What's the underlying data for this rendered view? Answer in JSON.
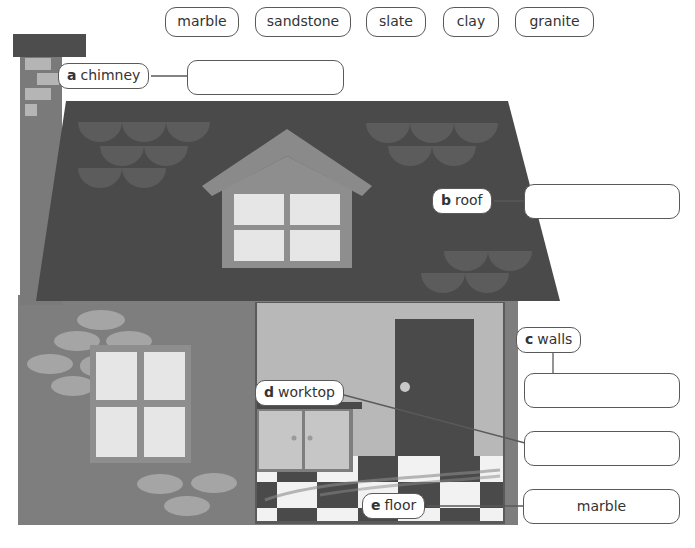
{
  "word_bank": {
    "words": [
      "marble",
      "sandstone",
      "slate",
      "clay",
      "granite"
    ]
  },
  "labels": {
    "a": {
      "letter": "a",
      "text": "chimney"
    },
    "b": {
      "letter": "b",
      "text": "roof"
    },
    "c": {
      "letter": "c",
      "text": "walls"
    },
    "d": {
      "letter": "d",
      "text": "worktop"
    },
    "e": {
      "letter": "e",
      "text": "floor"
    }
  },
  "answers": {
    "a": "",
    "b": "",
    "c": "",
    "d": "",
    "e": "marble"
  },
  "colors": {
    "roof": "#4a4a4a",
    "roof_tiles": "#5c5c5c",
    "chimney_top": "#4d4d4d",
    "chimney_body": "#7a7a7a",
    "chimney_bricks": "#b5b5b5",
    "wall": "#7e7e7e",
    "stones": "#a5a5a5",
    "window_frame": "#8e8e8e",
    "window_pane": "#e6e6e6",
    "interior_wall": "#b8b8b8",
    "door": "#4a4a4a",
    "floor_dark": "#4a4a4a",
    "floor_light": "#f2f2f2",
    "outline": "#5a5a5a"
  }
}
